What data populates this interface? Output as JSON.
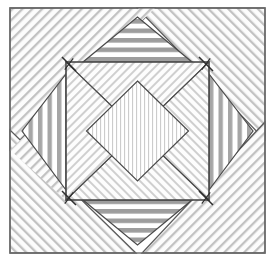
{
  "figure": {
    "type": "quilt-block",
    "canvas": {
      "width": 275,
      "height": 262,
      "background": "#ffffff"
    },
    "outer_square": {
      "x1": 10,
      "y1": 8,
      "x2": 265,
      "y2": 253
    },
    "inner_square": {
      "x1": 66,
      "y1": 62,
      "x2": 209,
      "y2": 200
    },
    "center_diamond": {
      "cx": 137.5,
      "cy": 131,
      "rx": 51,
      "ry": 50
    },
    "stroke": "#4a4a4a",
    "stroke_width": 1.2,
    "colors": {
      "diag_hatch_line": "#b9b9b9",
      "diag_hatch_bg": "#fbfbfb",
      "stripe_gray": "#9a9a9a",
      "stripe_white": "#ffffff",
      "vline_gray": "#a8a8a8",
      "fine_line": "#c9c9c9",
      "outline": "#4a4a4a",
      "seam_mark": "#2e2e2e"
    },
    "regions": [
      {
        "name": "corner-top-left",
        "shape": "triangle",
        "fill": "diagonal-hatch-nesw",
        "points": "10,8 155,8 10,150"
      },
      {
        "name": "corner-top-right",
        "shape": "triangle",
        "fill": "diagonal-hatch-nwse",
        "points": "137,8 265,8 265,140"
      },
      {
        "name": "corner-bottom-left",
        "shape": "triangle",
        "fill": "diagonal-hatch-nwse",
        "points": "10,130 10,253 136,253"
      },
      {
        "name": "corner-bottom-right",
        "shape": "triangle",
        "fill": "diagonal-hatch-nesw",
        "points": "265,122 265,253 142,253"
      },
      {
        "name": "ring-triangle-top",
        "shape": "triangle",
        "fill": "horizontal-stripes",
        "points": "83,62 192,62 137.5,17"
      },
      {
        "name": "ring-triangle-bottom",
        "shape": "triangle",
        "fill": "horizontal-stripes",
        "points": "83,200 192,200 137.5,245"
      },
      {
        "name": "ring-triangle-left",
        "shape": "triangle",
        "fill": "vertical-stripes",
        "points": "66,74 66,190 22,131"
      },
      {
        "name": "ring-triangle-right",
        "shape": "triangle",
        "fill": "vertical-stripes",
        "points": "209,74 209,190 253,131"
      },
      {
        "name": "inner-wedge-top",
        "shape": "triangle",
        "fill": "diagonal-hatch-fine",
        "points": "66,62 209,62 137.5,131"
      },
      {
        "name": "inner-wedge-right",
        "shape": "triangle",
        "fill": "diagonal-hatch-fine",
        "points": "209,62 209,200 137.5,131"
      },
      {
        "name": "inner-wedge-bottom",
        "shape": "triangle",
        "fill": "diagonal-hatch-fine",
        "points": "66,200 209,200 137.5,131"
      },
      {
        "name": "inner-wedge-left",
        "shape": "triangle",
        "fill": "diagonal-hatch-fine",
        "points": "66,62 66,200 137.5,131"
      },
      {
        "name": "center-diamond",
        "shape": "diamond",
        "fill": "fine-vertical-lines",
        "points": "137.5,81 188.5,131 137.5,181 86.5,131"
      }
    ],
    "seam_marks": [
      {
        "name": "seam-mark-top-left",
        "cx": 69,
        "cy": 64
      },
      {
        "name": "seam-mark-top-right",
        "cx": 206,
        "cy": 64
      },
      {
        "name": "seam-mark-bottom-left",
        "cx": 69,
        "cy": 198
      },
      {
        "name": "seam-mark-bottom-right",
        "cx": 206,
        "cy": 198
      }
    ]
  }
}
